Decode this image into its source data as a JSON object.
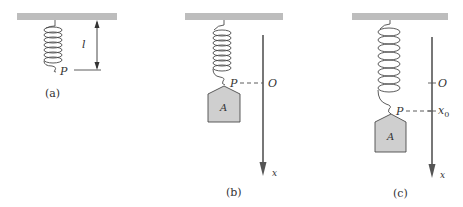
{
  "colors": {
    "ceiling": "#bdbdbd",
    "line": "#4a4a4a",
    "block_fill": "#cfcfcf",
    "axis": "#555555",
    "text": "#333333"
  },
  "panels": [
    {
      "id": "a",
      "caption": "(a)",
      "point_label": "P",
      "length_label": "l"
    },
    {
      "id": "b",
      "caption": "(b)",
      "point_label": "P",
      "origin_label": "O",
      "mass_label": "A",
      "axis_label": "x"
    },
    {
      "id": "c",
      "caption": "(c)",
      "point_label": "P",
      "origin_label": "O",
      "displacement_label": "x",
      "displacement_subscript": "0",
      "mass_label": "A",
      "axis_label": "x"
    }
  ]
}
